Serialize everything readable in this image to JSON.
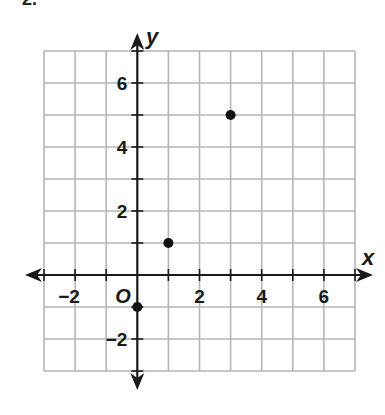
{
  "problem": {
    "number": "2."
  },
  "chart_data": {
    "type": "scatter",
    "title": "",
    "xlabel": "x",
    "ylabel": "y",
    "origin_label": "O",
    "xlim": [
      -3,
      7
    ],
    "ylim": [
      -3,
      7
    ],
    "grid": true,
    "x_ticks": [
      -2,
      2,
      4,
      6
    ],
    "y_ticks": [
      -2,
      2,
      4,
      6
    ],
    "x_tick_labels": [
      "−2",
      "2",
      "4",
      "6"
    ],
    "y_tick_labels": [
      "−2",
      "2",
      "4",
      "6"
    ],
    "points": [
      {
        "x": 0,
        "y": -1
      },
      {
        "x": 1,
        "y": 1
      },
      {
        "x": 3,
        "y": 5
      }
    ],
    "colors": {
      "grid": "#b5b5b5",
      "axis": "#1a1a1a",
      "point": "#111111"
    }
  }
}
